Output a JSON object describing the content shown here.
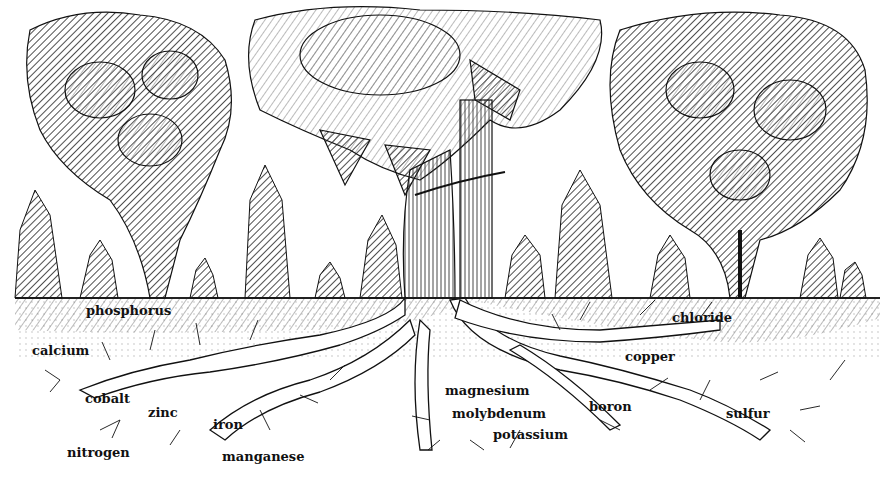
{
  "illustration": {
    "subject": "Tomato plants with root system absorbing soil nutrients",
    "colors": {
      "ink": "#111111",
      "paper": "#ffffff",
      "soil_hatch": "#555555"
    }
  },
  "nutrients": [
    {
      "id": "phosphorus",
      "label": "phosphorus",
      "x": 86,
      "y": 304
    },
    {
      "id": "calcium",
      "label": "calcium",
      "x": 32,
      "y": 344
    },
    {
      "id": "cobalt",
      "label": "cobalt",
      "x": 85,
      "y": 392
    },
    {
      "id": "zinc",
      "label": "zinc",
      "x": 148,
      "y": 406
    },
    {
      "id": "nitrogen",
      "label": "nitrogen",
      "x": 67,
      "y": 446
    },
    {
      "id": "iron",
      "label": "iron",
      "x": 213,
      "y": 418
    },
    {
      "id": "manganese",
      "label": "manganese",
      "x": 222,
      "y": 450
    },
    {
      "id": "magnesium",
      "label": "magnesium",
      "x": 445,
      "y": 384
    },
    {
      "id": "molybdenum",
      "label": "molybdenum",
      "x": 452,
      "y": 407
    },
    {
      "id": "potassium",
      "label": "potassium",
      "x": 493,
      "y": 428
    },
    {
      "id": "boron",
      "label": "boron",
      "x": 589,
      "y": 400
    },
    {
      "id": "chloride",
      "label": "chloride",
      "x": 672,
      "y": 311
    },
    {
      "id": "copper",
      "label": "copper",
      "x": 625,
      "y": 350
    },
    {
      "id": "sulfur",
      "label": "sulfur",
      "x": 726,
      "y": 407
    }
  ]
}
